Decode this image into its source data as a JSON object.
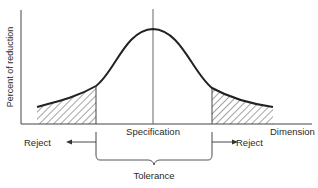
{
  "figure": {
    "y_axis_label": "Percent of reduction",
    "x_axis_label": "Dimension",
    "center_label": "Specification",
    "left_reject_label": "Reject",
    "right_reject_label": "Reject",
    "tolerance_label": "Tolerance",
    "curve_shape": "bell (normal distribution)",
    "shaded_regions": [
      "left tail outside tolerance",
      "right tail outside tolerance"
    ],
    "shading_style": "diagonal hatch",
    "line_color": "#222222",
    "background_color": "#ffffff"
  }
}
